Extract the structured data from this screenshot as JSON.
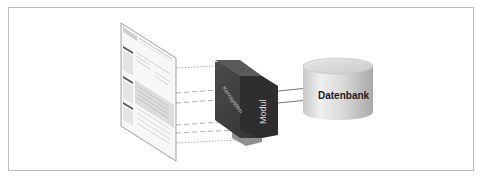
{
  "diagram": {
    "frame": {
      "border_color": "#bdbdbd"
    },
    "website_page": {
      "description": "perspective screenshot of a website page",
      "header_logo_text": "",
      "colors": {
        "page": "#f7f7f7",
        "border": "#8a8a8a",
        "sidebar_bar": "#555555",
        "text_lines": "#b8b8b8",
        "highlight_block": "#dcdcdc"
      }
    },
    "module_box": {
      "side_label": "Kernsystem",
      "front_label": "Modul",
      "colors": {
        "top": "#5a5a5a",
        "side": "#3e3e3e",
        "front": "#2e2e2e",
        "base": "#8f8f8f"
      }
    },
    "database": {
      "label": "Datenbank",
      "colors": {
        "body_light": "#e6e6e6",
        "body_dark": "#b5b5b5",
        "top": "#d9d9d9"
      }
    },
    "connectors": {
      "projection_lines": 6,
      "arrows_to_database": 2,
      "line_color": "#9a9a9a",
      "arrow_color": "#555555"
    }
  }
}
